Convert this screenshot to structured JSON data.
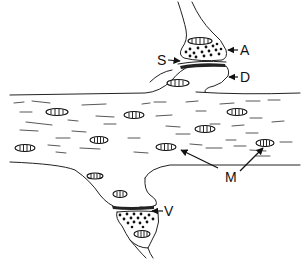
{
  "diagram": {
    "type": "synapse-illustration",
    "labels": {
      "A": "A",
      "S": "S",
      "D": "D",
      "M": "M",
      "V": "V"
    },
    "colors": {
      "ink": "#111111",
      "background": "#ffffff"
    }
  }
}
